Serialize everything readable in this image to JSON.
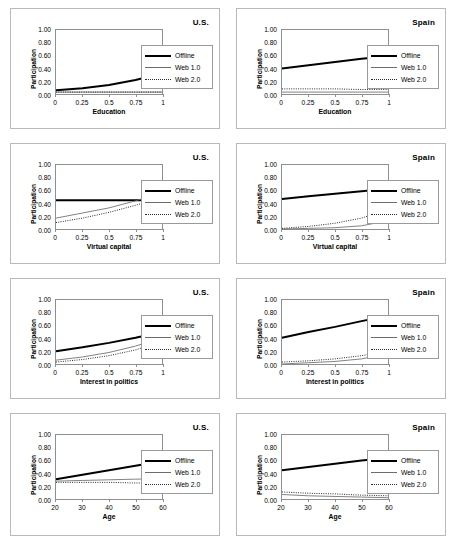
{
  "figure": {
    "panel_count": 8,
    "columns": [
      "U.S.",
      "Spain"
    ]
  },
  "legend": {
    "series": [
      {
        "key": "offline",
        "label": "Offline",
        "style": "thick-solid-black",
        "color": "#000000"
      },
      {
        "key": "web1",
        "label": "Web 1.0",
        "style": "thin-solid-gray",
        "color": "#6b6b6b"
      },
      {
        "key": "web2",
        "label": "Web 2.0",
        "style": "dotted",
        "color": "#2b2b2b"
      }
    ]
  },
  "axes": {
    "ylabel": "Participation",
    "yticks": [
      "0.00",
      "0.20",
      "0.40",
      "0.60",
      "0.80",
      "1.00"
    ],
    "ylim": [
      0,
      1
    ],
    "xticks_unit": [
      "0",
      "0.25",
      "0.5",
      "0.75",
      "1"
    ],
    "xlim_unit": [
      0,
      1
    ],
    "xticks_age": [
      "20",
      "30",
      "40",
      "50",
      "60"
    ],
    "xlim_age": [
      20,
      60
    ]
  },
  "chart_data": [
    {
      "type": "line",
      "panel": 1,
      "title": "U.S.",
      "xlabel": "Education",
      "ylabel": "Participation",
      "xlim": [
        0,
        1
      ],
      "ylim": [
        0,
        1
      ],
      "grid": false,
      "legend_position": "right",
      "x": [
        0,
        0.25,
        0.5,
        0.75,
        1
      ],
      "series": [
        {
          "name": "Offline",
          "values": [
            0.06,
            0.09,
            0.14,
            0.22,
            0.32
          ]
        },
        {
          "name": "Web 1.0",
          "values": [
            0.03,
            0.03,
            0.03,
            0.03,
            0.03
          ]
        },
        {
          "name": "Web 2.0",
          "values": [
            0.03,
            0.03,
            0.03,
            0.03,
            0.03
          ]
        }
      ]
    },
    {
      "type": "line",
      "panel": 2,
      "title": "Spain",
      "xlabel": "Education",
      "ylabel": "Participation",
      "xlim": [
        0,
        1
      ],
      "ylim": [
        0,
        1
      ],
      "grid": false,
      "legend_position": "right",
      "x": [
        0,
        0.25,
        0.5,
        0.75,
        1
      ],
      "series": [
        {
          "name": "Offline",
          "values": [
            0.4,
            0.45,
            0.5,
            0.55,
            0.59
          ]
        },
        {
          "name": "Web 1.0",
          "values": [
            0.03,
            0.03,
            0.03,
            0.03,
            0.03
          ]
        },
        {
          "name": "Web 2.0",
          "values": [
            0.08,
            0.08,
            0.08,
            0.07,
            0.07
          ]
        }
      ]
    },
    {
      "type": "line",
      "panel": 3,
      "title": "U.S.",
      "xlabel": "Virtual capital",
      "ylabel": "Participation",
      "xlim": [
        0,
        1
      ],
      "ylim": [
        0,
        1
      ],
      "grid": false,
      "legend_position": "right",
      "x": [
        0,
        0.25,
        0.5,
        0.75,
        1
      ],
      "series": [
        {
          "name": "Offline",
          "values": [
            0.45,
            0.45,
            0.45,
            0.45,
            0.45
          ]
        },
        {
          "name": "Web 1.0",
          "values": [
            0.17,
            0.25,
            0.33,
            0.44,
            0.57
          ]
        },
        {
          "name": "Web 2.0",
          "values": [
            0.1,
            0.17,
            0.26,
            0.37,
            0.5
          ]
        }
      ]
    },
    {
      "type": "line",
      "panel": 4,
      "title": "Spain",
      "xlabel": "Virtual capital",
      "ylabel": "Participation",
      "xlim": [
        0,
        1
      ],
      "ylim": [
        0,
        1
      ],
      "grid": false,
      "legend_position": "right",
      "x": [
        0,
        0.25,
        0.5,
        0.75,
        1
      ],
      "series": [
        {
          "name": "Offline",
          "values": [
            0.47,
            0.51,
            0.55,
            0.59,
            0.63
          ]
        },
        {
          "name": "Web 1.0",
          "values": [
            0.0,
            0.01,
            0.02,
            0.05,
            0.13
          ]
        },
        {
          "name": "Web 2.0",
          "values": [
            0.01,
            0.04,
            0.09,
            0.17,
            0.31
          ]
        }
      ]
    },
    {
      "type": "line",
      "panel": 5,
      "title": "U.S.",
      "xlabel": "Interest in politics",
      "ylabel": "Participation",
      "xlim": [
        0,
        1
      ],
      "ylim": [
        0,
        1
      ],
      "grid": false,
      "legend_position": "right",
      "x": [
        0,
        0.25,
        0.5,
        0.75,
        1
      ],
      "series": [
        {
          "name": "Offline",
          "values": [
            0.2,
            0.26,
            0.33,
            0.41,
            0.5
          ]
        },
        {
          "name": "Web 1.0",
          "values": [
            0.06,
            0.11,
            0.18,
            0.28,
            0.41
          ]
        },
        {
          "name": "Web 2.0",
          "values": [
            0.03,
            0.07,
            0.13,
            0.22,
            0.35
          ]
        }
      ]
    },
    {
      "type": "line",
      "panel": 6,
      "title": "Spain",
      "xlabel": "Interest in politics",
      "ylabel": "Participation",
      "xlim": [
        0,
        1
      ],
      "ylim": [
        0,
        1
      ],
      "grid": false,
      "legend_position": "right",
      "x": [
        0,
        0.25,
        0.5,
        0.75,
        1
      ],
      "series": [
        {
          "name": "Offline",
          "values": [
            0.41,
            0.5,
            0.58,
            0.67,
            0.75
          ]
        },
        {
          "name": "Web 1.0",
          "values": [
            0.0,
            0.02,
            0.04,
            0.08,
            0.16
          ]
        },
        {
          "name": "Web 2.0",
          "values": [
            0.03,
            0.05,
            0.08,
            0.13,
            0.2
          ]
        }
      ]
    },
    {
      "type": "line",
      "panel": 7,
      "title": "U.S.",
      "xlabel": "Age",
      "ylabel": "Participation",
      "xlim": [
        20,
        60
      ],
      "ylim": [
        0,
        1
      ],
      "grid": false,
      "legend_position": "right",
      "x": [
        20,
        30,
        40,
        50,
        60
      ],
      "series": [
        {
          "name": "Offline",
          "values": [
            0.31,
            0.38,
            0.45,
            0.52,
            0.59
          ]
        },
        {
          "name": "Web 1.0",
          "values": [
            0.28,
            0.29,
            0.3,
            0.31,
            0.32
          ]
        },
        {
          "name": "Web 2.0",
          "values": [
            0.26,
            0.26,
            0.26,
            0.25,
            0.25
          ]
        }
      ]
    },
    {
      "type": "line",
      "panel": 8,
      "title": "Spain",
      "xlabel": "Age",
      "ylabel": "Participation",
      "xlim": [
        20,
        60
      ],
      "ylim": [
        0,
        1
      ],
      "grid": false,
      "legend_position": "right",
      "x": [
        20,
        30,
        40,
        50,
        60
      ],
      "series": [
        {
          "name": "Offline",
          "values": [
            0.45,
            0.5,
            0.55,
            0.6,
            0.64
          ]
        },
        {
          "name": "Web 1.0",
          "values": [
            0.07,
            0.05,
            0.04,
            0.03,
            0.02
          ]
        },
        {
          "name": "Web 2.0",
          "values": [
            0.11,
            0.09,
            0.08,
            0.06,
            0.05
          ]
        }
      ]
    }
  ]
}
